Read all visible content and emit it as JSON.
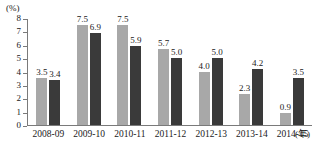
{
  "chart_data": {
    "type": "bar",
    "title": "",
    "subtitle": "",
    "xlabel": "(年)",
    "ylabel": "(%)",
    "ylim": [
      0,
      8
    ],
    "yticks": [
      "0",
      "1",
      "2",
      "3",
      "4",
      "5",
      "6",
      "7",
      "8"
    ],
    "grid": false,
    "legend": "none",
    "categories": [
      "2008-09",
      "2009-10",
      "2010-11",
      "2011-12",
      "2012-13",
      "2013-14",
      "2014-15"
    ],
    "series": [
      {
        "name": "series-light",
        "color": "#a8a8a8",
        "values": [
          3.5,
          7.5,
          7.5,
          5.7,
          4.0,
          2.3,
          0.9
        ],
        "labels": [
          "3.5",
          "7.5",
          "7.5",
          "5.7",
          "4.0",
          "2.3",
          "0.9"
        ]
      },
      {
        "name": "series-dark",
        "color": "#3a3a3a",
        "values": [
          3.4,
          6.9,
          5.9,
          5.0,
          5.0,
          4.2,
          3.5
        ],
        "labels": [
          "3.4",
          "6.9",
          "5.9",
          "5.0",
          "5.0",
          "4.2",
          "3.5"
        ]
      }
    ]
  },
  "axis": {
    "y_unit": "(%)",
    "x_unit": "(年)"
  }
}
